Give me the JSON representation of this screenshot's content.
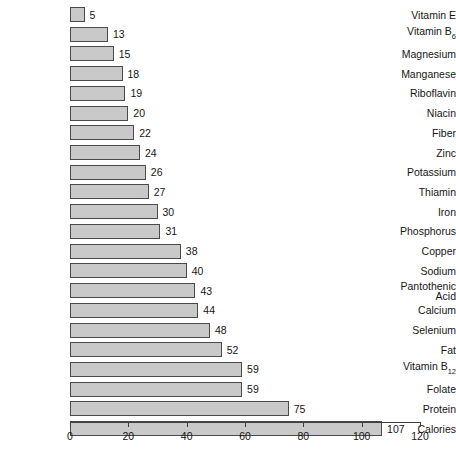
{
  "chart_data": {
    "type": "bar",
    "orientation": "horizontal",
    "title": "",
    "xlabel": "",
    "ylabel": "",
    "xlim": [
      0,
      120
    ],
    "xticks": [
      0,
      20,
      40,
      60,
      80,
      100,
      120
    ],
    "grid": false,
    "legend": null,
    "value_labels": true,
    "categories": [
      "Vitamin E",
      "Vitamin B6",
      "Magnesium",
      "Manganese",
      "Riboflavin",
      "Niacin",
      "Fiber",
      "Zinc",
      "Potassium",
      "Thiamin",
      "Iron",
      "Phosphorus",
      "Copper",
      "Sodium",
      "Pantothenic Acid",
      "Calcium",
      "Selenium",
      "Fat",
      "Vitamin B12",
      "Folate",
      "Protein",
      "Calories"
    ],
    "values": [
      5,
      13,
      15,
      18,
      19,
      20,
      22,
      24,
      26,
      27,
      30,
      31,
      38,
      40,
      43,
      44,
      48,
      52,
      59,
      59,
      75,
      107
    ]
  },
  "bars": [
    {
      "label": "Vitamin E",
      "label_html": "Vitamin E",
      "value": 5,
      "value_text": "5"
    },
    {
      "label": "Vitamin B6",
      "label_html": "Vitamin B",
      "sub": "6",
      "value": 13,
      "value_text": "13"
    },
    {
      "label": "Magnesium",
      "label_html": "Magnesium",
      "value": 15,
      "value_text": "15"
    },
    {
      "label": "Manganese",
      "label_html": "Manganese",
      "value": 18,
      "value_text": "18"
    },
    {
      "label": "Riboflavin",
      "label_html": "Riboflavin",
      "value": 19,
      "value_text": "19"
    },
    {
      "label": "Niacin",
      "label_html": "Niacin",
      "value": 20,
      "value_text": "20"
    },
    {
      "label": "Fiber",
      "label_html": "Fiber",
      "value": 22,
      "value_text": "22"
    },
    {
      "label": "Zinc",
      "label_html": "Zinc",
      "value": 24,
      "value_text": "24"
    },
    {
      "label": "Potassium",
      "label_html": "Potassium",
      "value": 26,
      "value_text": "26"
    },
    {
      "label": "Thiamin",
      "label_html": "Thiamin",
      "value": 27,
      "value_text": "27"
    },
    {
      "label": "Iron",
      "label_html": "Iron",
      "value": 30,
      "value_text": "30"
    },
    {
      "label": "Phosphorus",
      "label_html": "Phosphorus",
      "value": 31,
      "value_text": "31"
    },
    {
      "label": "Copper",
      "label_html": "Copper",
      "value": 38,
      "value_text": "38"
    },
    {
      "label": "Sodium",
      "label_html": "Sodium",
      "value": 40,
      "value_text": "40"
    },
    {
      "label": "Pantothenic Acid",
      "label_html": "Pantothenic\nAcid",
      "value": 43,
      "value_text": "43"
    },
    {
      "label": "Calcium",
      "label_html": "Calcium",
      "value": 44,
      "value_text": "44"
    },
    {
      "label": "Selenium",
      "label_html": "Selenium",
      "value": 48,
      "value_text": "48"
    },
    {
      "label": "Fat",
      "label_html": "Fat",
      "value": 52,
      "value_text": "52"
    },
    {
      "label": "Vitamin B12",
      "label_html": "Vitamin B",
      "sub": "12",
      "value": 59,
      "value_text": "59"
    },
    {
      "label": "Folate",
      "label_html": "Folate",
      "value": 59,
      "value_text": "59"
    },
    {
      "label": "Protein",
      "label_html": "Protein",
      "value": 75,
      "value_text": "75"
    },
    {
      "label": "Calories",
      "label_html": "Calories",
      "value": 107,
      "value_text": "107"
    }
  ],
  "axis": {
    "ticks": [
      "0",
      "20",
      "40",
      "60",
      "80",
      "100",
      "120"
    ]
  },
  "colors": {
    "bar_fill": "#c9c9c9",
    "bar_border": "#4a4a4a",
    "text": "#161616",
    "axis": "#3d3d3d",
    "background": "#ffffff"
  }
}
